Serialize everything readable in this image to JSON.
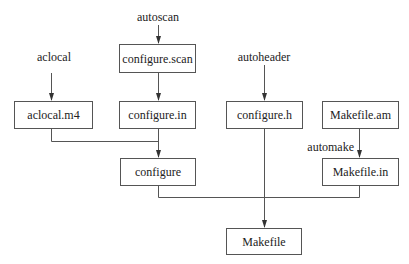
{
  "diagram": {
    "title": "",
    "nodes": [
      {
        "id": "aclocal_m4",
        "label": "aclocal.m4"
      },
      {
        "id": "configure_scan",
        "label": "configure.scan"
      },
      {
        "id": "configure_in",
        "label": "configure.in"
      },
      {
        "id": "configure",
        "label": "configure"
      },
      {
        "id": "configure_h",
        "label": "configure.h"
      },
      {
        "id": "makefile_am",
        "label": "Makefile.am"
      },
      {
        "id": "makefile_in",
        "label": "Makefile.in"
      },
      {
        "id": "makefile",
        "label": "Makefile"
      }
    ],
    "tools": [
      {
        "id": "aclocal",
        "label": "aclocal",
        "produces": "aclocal.m4"
      },
      {
        "id": "autoscan",
        "label": "autoscan",
        "produces": "configure.scan"
      },
      {
        "id": "autoheader",
        "label": "autoheader",
        "produces": "configure.h"
      },
      {
        "id": "automake",
        "label": "automake",
        "produces": "Makefile.in"
      }
    ],
    "edges": [
      {
        "from": "aclocal",
        "to": "aclocal.m4"
      },
      {
        "from": "autoscan",
        "to": "configure.scan"
      },
      {
        "from": "configure.scan",
        "to": "configure.in"
      },
      {
        "from": "aclocal.m4",
        "to": "configure"
      },
      {
        "from": "configure.in",
        "to": "configure"
      },
      {
        "from": "autoheader",
        "to": "configure.h"
      },
      {
        "from": "Makefile.am",
        "to": "Makefile.in",
        "label": "automake"
      },
      {
        "from": "configure",
        "to": "Makefile"
      },
      {
        "from": "configure.h",
        "to": "Makefile"
      },
      {
        "from": "Makefile.in",
        "to": "Makefile"
      }
    ],
    "colors": {
      "line": "#555555",
      "text": "#222222",
      "background": "#ffffff"
    }
  }
}
